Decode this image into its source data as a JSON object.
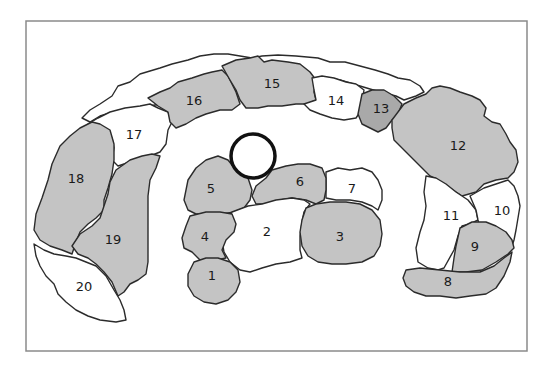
{
  "diagram": {
    "type": "numbered-region-map",
    "colors": {
      "shaded": "#c4c4c4",
      "dark": "#a9a9a9",
      "empty": "#ffffff",
      "outline": "#2b2b2b",
      "frame": "#8a8a8a"
    },
    "central_ring": {
      "cx": 253,
      "cy": 156,
      "r": 22
    },
    "regions": [
      {
        "id": "1",
        "label": "1",
        "fill": "shaded",
        "lx": 212,
        "ly": 276
      },
      {
        "id": "2",
        "label": "2",
        "fill": "empty",
        "lx": 267,
        "ly": 232
      },
      {
        "id": "3",
        "label": "3",
        "fill": "shaded",
        "lx": 340,
        "ly": 237
      },
      {
        "id": "4",
        "label": "4",
        "fill": "shaded",
        "lx": 205,
        "ly": 237
      },
      {
        "id": "5",
        "label": "5",
        "fill": "shaded",
        "lx": 211,
        "ly": 189
      },
      {
        "id": "6",
        "label": "6",
        "fill": "shaded",
        "lx": 300,
        "ly": 182
      },
      {
        "id": "7",
        "label": "7",
        "fill": "empty",
        "lx": 352,
        "ly": 189
      },
      {
        "id": "8",
        "label": "8",
        "fill": "shaded",
        "lx": 448,
        "ly": 282
      },
      {
        "id": "9",
        "label": "9",
        "fill": "shaded",
        "lx": 475,
        "ly": 247
      },
      {
        "id": "10",
        "label": "10",
        "fill": "empty",
        "lx": 502,
        "ly": 211
      },
      {
        "id": "11",
        "label": "11",
        "fill": "empty",
        "lx": 451,
        "ly": 216
      },
      {
        "id": "12",
        "label": "12",
        "fill": "shaded",
        "lx": 458,
        "ly": 146
      },
      {
        "id": "13",
        "label": "13",
        "fill": "dark",
        "lx": 381,
        "ly": 109
      },
      {
        "id": "14",
        "label": "14",
        "fill": "empty",
        "lx": 336,
        "ly": 101
      },
      {
        "id": "15",
        "label": "15",
        "fill": "shaded",
        "lx": 272,
        "ly": 84
      },
      {
        "id": "16",
        "label": "16",
        "fill": "shaded",
        "lx": 194,
        "ly": 101
      },
      {
        "id": "17",
        "label": "17",
        "fill": "empty",
        "lx": 134,
        "ly": 135
      },
      {
        "id": "18",
        "label": "18",
        "fill": "shaded",
        "lx": 76,
        "ly": 179
      },
      {
        "id": "19",
        "label": "19",
        "fill": "shaded",
        "lx": 113,
        "ly": 240
      },
      {
        "id": "20",
        "label": "20",
        "fill": "empty",
        "lx": 84,
        "ly": 287
      }
    ]
  }
}
